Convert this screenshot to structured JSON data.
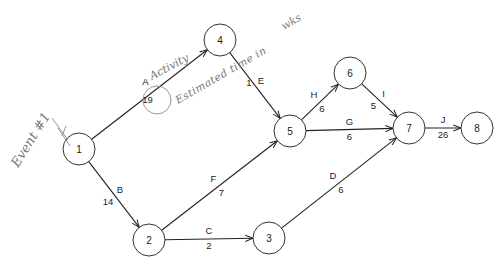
{
  "diagram": {
    "type": "activity-on-arrow network (PERT/CPM)",
    "nodes": [
      {
        "id": "1",
        "label": "1",
        "x": 79,
        "y": 149
      },
      {
        "id": "2",
        "label": "2",
        "x": 149,
        "y": 240
      },
      {
        "id": "3",
        "label": "3",
        "x": 269,
        "y": 238
      },
      {
        "id": "4",
        "label": "4",
        "x": 220,
        "y": 40
      },
      {
        "id": "5",
        "label": "5",
        "x": 290,
        "y": 131
      },
      {
        "id": "6",
        "label": "6",
        "x": 350,
        "y": 73
      },
      {
        "id": "7",
        "label": "7",
        "x": 409,
        "y": 128
      },
      {
        "id": "8",
        "label": "8",
        "x": 477,
        "y": 128
      }
    ],
    "edges": [
      {
        "activity": "A",
        "duration": "19",
        "from": "1",
        "to": "4"
      },
      {
        "activity": "B",
        "duration": "14",
        "from": "1",
        "to": "2"
      },
      {
        "activity": "C",
        "duration": "2",
        "from": "2",
        "to": "3"
      },
      {
        "activity": "D",
        "duration": "6",
        "from": "3",
        "to": "7"
      },
      {
        "activity": "E",
        "duration": "1",
        "from": "4",
        "to": "5"
      },
      {
        "activity": "F",
        "duration": "7",
        "from": "2",
        "to": "5"
      },
      {
        "activity": "G",
        "duration": "6",
        "from": "5",
        "to": "7"
      },
      {
        "activity": "H",
        "duration": "6",
        "from": "5",
        "to": "6"
      },
      {
        "activity": "I",
        "duration": "5",
        "from": "6",
        "to": "7"
      },
      {
        "activity": "J",
        "duration": "26",
        "from": "7",
        "to": "8"
      }
    ],
    "annotations": {
      "event": "Event #1",
      "activity": "Activity",
      "estimated_time": "Estimated time in",
      "units": "wks"
    }
  }
}
